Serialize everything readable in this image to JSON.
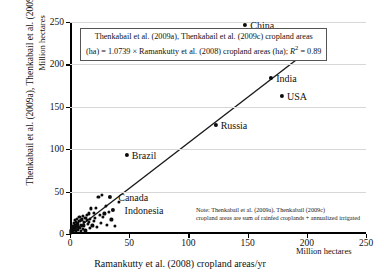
{
  "chart_data": {
    "type": "scatter",
    "title": "",
    "xlabel": "Ramankutty et al. (2008) cropland areas/yr",
    "ylabel": "Thenkabail et al. (2009a), Thenkabail et al. (2009b) cropland areas/yr",
    "x_units": "Million hectares",
    "y_units": "Million hectares",
    "xlim": [
      0,
      250
    ],
    "ylim": [
      0,
      250
    ],
    "xticks": [
      "0",
      "50",
      "100",
      "150",
      "200",
      "250"
    ],
    "yticks": [
      "0",
      "50",
      "100",
      "150",
      "200",
      "250"
    ],
    "grid": "horizontal",
    "legend": "none",
    "equation_line1": "Thenkabail et al. (2009a), Thenkabail et al. (2009c) cropland areas",
    "equation_line2_pre": "(ha) = 1.0739 × Ramankutty et al. (2008) cropland areas (ha); ",
    "equation_r2_var": "R",
    "equation_r2_sup": "2",
    "equation_r2_val": " = 0.89",
    "note_line1": "Note: Thenkabail et al. (2009a), Thenkabail (2009c)",
    "note_line2": "cropland areas are sum of rainfed croplands + annualized irrigated",
    "trend": {
      "x0": 0,
      "y0": 0,
      "x1": 200,
      "y1": 215
    },
    "labeled_points": [
      {
        "name": "China",
        "x": 148,
        "y": 246,
        "label": "China",
        "label_dx": 5,
        "label_dy": 0
      },
      {
        "name": "India",
        "x": 170,
        "y": 184,
        "label": "India",
        "label_dx": 5,
        "label_dy": 0
      },
      {
        "name": "USA",
        "x": 179,
        "y": 163,
        "label": "USA",
        "label_dx": 5,
        "label_dy": 0
      },
      {
        "name": "Russia",
        "x": 123,
        "y": 128,
        "label": "Russia",
        "label_dx": 5,
        "label_dy": 0
      },
      {
        "name": "Brazil",
        "x": 48,
        "y": 93,
        "label": "Brazil",
        "label_dx": 5,
        "label_dy": 0
      },
      {
        "name": "Canada",
        "x": 34,
        "y": 44,
        "label": "Canada",
        "label_dx": 8,
        "label_dy": 0
      },
      {
        "name": "Indonesia",
        "x": 36,
        "y": 28,
        "label": "Indonesia",
        "label_dx": 12,
        "label_dy": 0
      }
    ],
    "points": [
      {
        "x": 148,
        "y": 246
      },
      {
        "x": 170,
        "y": 184
      },
      {
        "x": 179,
        "y": 163
      },
      {
        "x": 123,
        "y": 128
      },
      {
        "x": 48,
        "y": 93
      },
      {
        "x": 34,
        "y": 44
      },
      {
        "x": 24,
        "y": 44
      },
      {
        "x": 27,
        "y": 46
      },
      {
        "x": 36,
        "y": 28
      },
      {
        "x": 41,
        "y": 38
      },
      {
        "x": 30,
        "y": 33
      },
      {
        "x": 22,
        "y": 31
      },
      {
        "x": 18,
        "y": 30
      },
      {
        "x": 20,
        "y": 25
      },
      {
        "x": 16,
        "y": 24
      },
      {
        "x": 14,
        "y": 22
      },
      {
        "x": 13,
        "y": 19
      },
      {
        "x": 11,
        "y": 21
      },
      {
        "x": 10,
        "y": 17
      },
      {
        "x": 9,
        "y": 16
      },
      {
        "x": 8,
        "y": 15
      },
      {
        "x": 7,
        "y": 13
      },
      {
        "x": 6,
        "y": 12
      },
      {
        "x": 5,
        "y": 11
      },
      {
        "x": 5,
        "y": 9
      },
      {
        "x": 4,
        "y": 10
      },
      {
        "x": 4,
        "y": 8
      },
      {
        "x": 3,
        "y": 7
      },
      {
        "x": 3,
        "y": 6
      },
      {
        "x": 2,
        "y": 5
      },
      {
        "x": 2,
        "y": 4
      },
      {
        "x": 2,
        "y": 3
      },
      {
        "x": 1,
        "y": 3
      },
      {
        "x": 1,
        "y": 2
      },
      {
        "x": 1,
        "y": 1
      },
      {
        "x": 6,
        "y": 18
      },
      {
        "x": 8,
        "y": 20
      },
      {
        "x": 12,
        "y": 14
      },
      {
        "x": 15,
        "y": 12
      },
      {
        "x": 19,
        "y": 10
      },
      {
        "x": 26,
        "y": 13
      },
      {
        "x": 31,
        "y": 11
      },
      {
        "x": 38,
        "y": 9
      },
      {
        "x": 23,
        "y": 8
      },
      {
        "x": 17,
        "y": 7
      },
      {
        "x": 11,
        "y": 6
      },
      {
        "x": 7,
        "y": 5
      },
      {
        "x": 5,
        "y": 4
      },
      {
        "x": 9,
        "y": 3
      },
      {
        "x": 13,
        "y": 4
      },
      {
        "x": 3,
        "y": 13
      },
      {
        "x": 4,
        "y": 16
      },
      {
        "x": 2,
        "y": 9
      },
      {
        "x": 6,
        "y": 8
      },
      {
        "x": 10,
        "y": 9
      },
      {
        "x": 12,
        "y": 10
      },
      {
        "x": 14,
        "y": 16
      },
      {
        "x": 17,
        "y": 18
      },
      {
        "x": 21,
        "y": 19
      },
      {
        "x": 25,
        "y": 22
      },
      {
        "x": 29,
        "y": 24
      },
      {
        "x": 33,
        "y": 26
      },
      {
        "x": 20,
        "y": 15
      },
      {
        "x": 16,
        "y": 14
      },
      {
        "x": 1,
        "y": 5
      },
      {
        "x": 2,
        "y": 7
      },
      {
        "x": 3,
        "y": 9
      },
      {
        "x": 4,
        "y": 6
      },
      {
        "x": 5,
        "y": 14
      },
      {
        "x": 7,
        "y": 10
      },
      {
        "x": 8,
        "y": 7
      },
      {
        "x": 9,
        "y": 11
      },
      {
        "x": 28,
        "y": 20
      },
      {
        "x": 35,
        "y": 17
      }
    ]
  }
}
